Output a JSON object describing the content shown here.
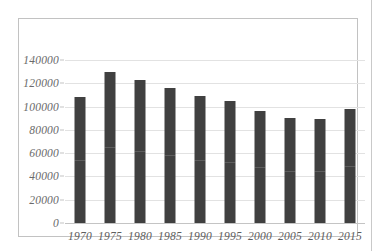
{
  "chart_data": {
    "type": "bar",
    "title": "",
    "subtitle": "",
    "xlabel": "",
    "ylabel": "",
    "categories": [
      "1970",
      "1975",
      "1980",
      "1985",
      "1990",
      "1995",
      "2000",
      "2005",
      "2010",
      "2015"
    ],
    "values": [
      108500,
      130000,
      123000,
      116000,
      109000,
      105000,
      96000,
      90000,
      89500,
      97500
    ],
    "series": [
      {
        "name": "",
        "values": [
          108500,
          130000,
          123000,
          116000,
          109000,
          105000,
          96000,
          90000,
          89500,
          97500
        ]
      }
    ],
    "ylim": [
      0,
      140000
    ],
    "ytick_values": [
      0,
      20000,
      40000,
      60000,
      80000,
      100000,
      120000,
      140000
    ],
    "ytick_labels": [
      "0",
      "20000",
      "40000",
      "60000",
      "80000",
      "100000",
      "120000",
      "140000"
    ],
    "xtick_labels": [
      "1970",
      "1975",
      "1980",
      "1985",
      "1990",
      "1995",
      "2000",
      "2005",
      "2010",
      "2015"
    ],
    "grid": true,
    "grid_axis": "y",
    "legend": false,
    "legend_position": "none",
    "bar_color": "#404040",
    "gridline_color": "#e2e2e2",
    "axis_color": "#c4c4c4",
    "frame_color": "#c2c2c2",
    "tick_label_color": "#6a6a6a",
    "background_color": "#ffffff"
  }
}
